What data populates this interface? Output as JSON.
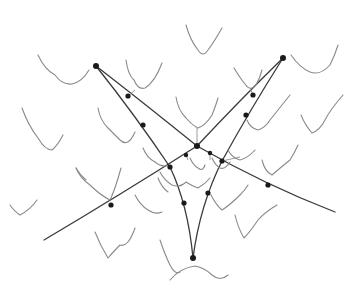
{
  "diagram": {
    "type": "graph with energy-landscape curves",
    "colors": {
      "background": "#ffffff",
      "edge": "#3a3a3a",
      "node": "#1a1a1a",
      "curve": "#8a8a8a"
    },
    "nodes": [
      {
        "id": "top-left",
        "x": 96,
        "y": 66
      },
      {
        "id": "top-right",
        "x": 283,
        "y": 58
      },
      {
        "id": "center",
        "x": 197,
        "y": 146
      },
      {
        "id": "bottom",
        "x": 193,
        "y": 258
      },
      {
        "id": "n1",
        "x": 128,
        "y": 96
      },
      {
        "id": "n2",
        "x": 143,
        "y": 125
      },
      {
        "id": "n3",
        "x": 111,
        "y": 205
      },
      {
        "id": "n4",
        "x": 170,
        "y": 167
      },
      {
        "id": "n5",
        "x": 184,
        "y": 203
      },
      {
        "id": "n6",
        "x": 208,
        "y": 193
      },
      {
        "id": "n7",
        "x": 222,
        "y": 161
      },
      {
        "id": "n8",
        "x": 246,
        "y": 115
      },
      {
        "id": "n9",
        "x": 253,
        "y": 95
      },
      {
        "id": "n10",
        "x": 268,
        "y": 185
      },
      {
        "id": "n11",
        "x": 186,
        "y": 155
      },
      {
        "id": "n12",
        "x": 210,
        "y": 153
      }
    ],
    "edges_count": 6,
    "curves_count": 26
  }
}
